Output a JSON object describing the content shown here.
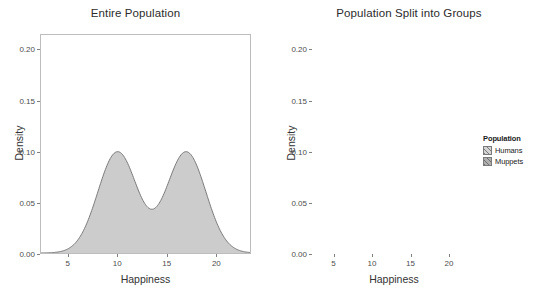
{
  "figure": {
    "width": 542,
    "height": 296,
    "background": "#ffffff"
  },
  "colors": {
    "humans_fill": "#d4d4d4",
    "muppets_fill": "#b0b0b0",
    "overlap_fill": "#9a9a9a",
    "combined_fill": "#cccccc",
    "curve_stroke": "#6e6e6e",
    "panel_border": "#bdbdbd",
    "axis_text": "#4d4d4d",
    "title_text": "#2b2b2b"
  },
  "legend": {
    "title": "Population",
    "items": [
      {
        "label": "Humans",
        "fill": "#d4d4d4"
      },
      {
        "label": "Muppets",
        "fill": "#b0b0b0"
      }
    ]
  },
  "chart_data": [
    {
      "id": "entire-population",
      "type": "area",
      "title": "Entire Population",
      "xlabel": "Happiness",
      "ylabel": "Density",
      "xlim": [
        2.2,
        23.5
      ],
      "ylim": [
        0.0,
        0.215
      ],
      "xticks": [
        5,
        10,
        15,
        20
      ],
      "xtick_labels": [
        "5",
        "10",
        "15",
        "20"
      ],
      "yticks": [
        0.0,
        0.05,
        0.1,
        0.15,
        0.2
      ],
      "ytick_labels": [
        "0.00",
        "0.05",
        "0.10",
        "0.15",
        "0.20"
      ],
      "grid": false,
      "legend_position": "none",
      "series": [
        {
          "name": "Entire Population",
          "fill": "#cccccc",
          "stroke": "#6e6e6e",
          "kind": "kde-mixture",
          "components": [
            {
              "weight": 0.5,
              "mean": 10.0,
              "sd": 2.0
            },
            {
              "weight": 0.5,
              "mean": 17.0,
              "sd": 2.0
            }
          ],
          "peaks": [
            {
              "x": 10.0,
              "y": 0.095
            },
            {
              "x": 17.0,
              "y": 0.096
            }
          ],
          "valley": {
            "x": 13.5,
            "y": 0.047
          }
        }
      ]
    },
    {
      "id": "population-split-into-groups",
      "type": "area",
      "title": "Population Split into Groups",
      "xlabel": "Happiness",
      "ylabel": "Density",
      "xlim": [
        2.2,
        23.5
      ],
      "ylim": [
        0.0,
        0.215
      ],
      "xticks": [
        5,
        10,
        15,
        20
      ],
      "xtick_labels": [
        "5",
        "10",
        "15",
        "20"
      ],
      "yticks": [
        0.0,
        0.05,
        0.1,
        0.15,
        0.2
      ],
      "ytick_labels": [
        "0.00",
        "0.05",
        "0.10",
        "0.15",
        "0.20"
      ],
      "grid": false,
      "legend_position": "right",
      "series": [
        {
          "name": "Humans",
          "fill": "#d4d4d4",
          "stroke": "#6e6e6e",
          "kind": "kde-normal",
          "mean": 9.9,
          "sd": 2.05,
          "peak": {
            "x": 9.9,
            "y": 0.195
          }
        },
        {
          "name": "Muppets",
          "fill": "#b0b0b0",
          "stroke": "#6e6e6e",
          "kind": "kde-normal",
          "mean": 17.0,
          "sd": 2.0,
          "peak": {
            "x": 17.0,
            "y": 0.199
          }
        }
      ]
    }
  ]
}
